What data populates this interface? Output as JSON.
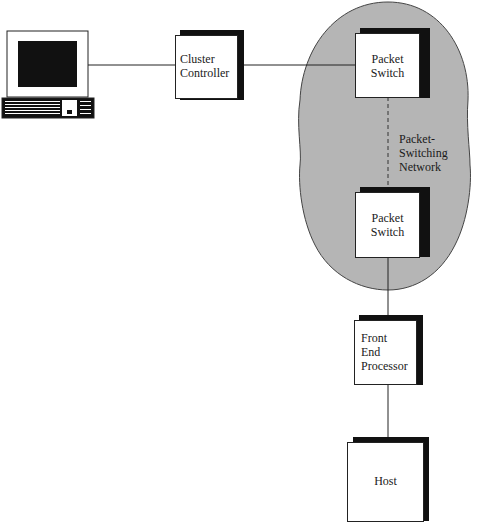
{
  "diagram": {
    "nodes": {
      "terminal": {
        "label": "",
        "icon": "terminal-icon"
      },
      "cluster_controller": {
        "label_line1": "Cluster",
        "label_line2": "Controller"
      },
      "packet_switch_top": {
        "label_line1": "Packet",
        "label_line2": "Switch"
      },
      "packet_switch_bottom": {
        "label_line1": "Packet",
        "label_line2": "Switch"
      },
      "front_end_processor": {
        "label_line1": "Front",
        "label_line2": "End",
        "label_line3": "Processor"
      },
      "host": {
        "label": "Host"
      }
    },
    "network": {
      "label_line1": "Packet-",
      "label_line2": "Switching",
      "label_line3": "Network",
      "fill_color": "#b5b5b5"
    },
    "edges": [
      {
        "from": "terminal",
        "to": "cluster_controller",
        "style": "solid"
      },
      {
        "from": "cluster_controller",
        "to": "packet_switch_top",
        "style": "solid"
      },
      {
        "from": "packet_switch_top",
        "to": "packet_switch_bottom",
        "style": "dashed"
      },
      {
        "from": "packet_switch_bottom",
        "to": "front_end_processor",
        "style": "solid"
      },
      {
        "from": "front_end_processor",
        "to": "host",
        "style": "solid"
      }
    ]
  }
}
